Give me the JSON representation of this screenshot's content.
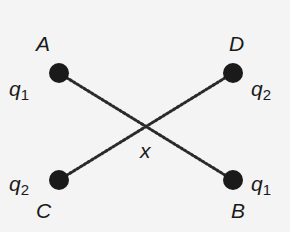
{
  "diagram": {
    "points": [
      {
        "id": "A",
        "label": "A",
        "charge": "q",
        "charge_sub": "1",
        "x": 59,
        "y": 73
      },
      {
        "id": "D",
        "label": "D",
        "charge": "q",
        "charge_sub": "2",
        "x": 233,
        "y": 73
      },
      {
        "id": "C",
        "label": "C",
        "charge": "q",
        "charge_sub": "2",
        "x": 59,
        "y": 180
      },
      {
        "id": "B",
        "label": "B",
        "charge": "q",
        "charge_sub": "1",
        "x": 233,
        "y": 180
      }
    ],
    "center_label": "x",
    "lines": [
      {
        "from": "A",
        "to": "B",
        "style": "dotted"
      },
      {
        "from": "C",
        "to": "D",
        "style": "dotted"
      }
    ],
    "colors": {
      "dot": "#1a1a1a",
      "line": "#2a2a2a",
      "background": "#f4f4f4"
    }
  }
}
